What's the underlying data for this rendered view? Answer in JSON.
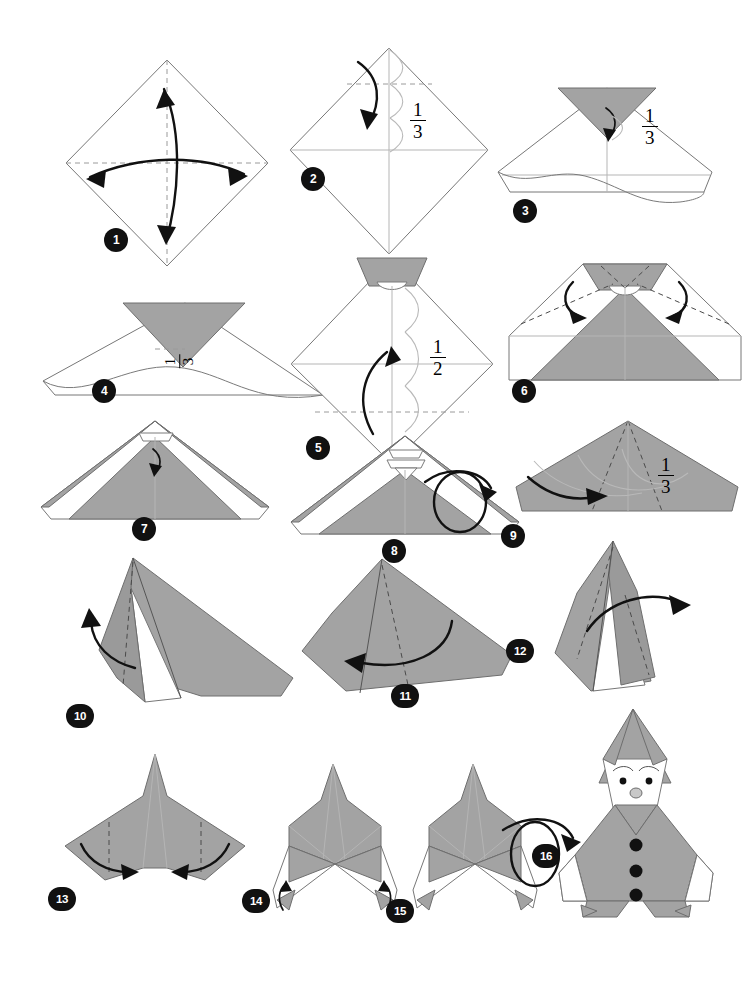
{
  "document": {
    "type": "origami-instruction-diagram",
    "model_name": "Santa Claus",
    "total_steps": 16,
    "page_background": "#ffffff",
    "paper_colors": {
      "front_white": "#ffffff",
      "back_gray": "#a3a3a3",
      "line": "#6e6e6e"
    }
  },
  "steps": [
    {
      "number": "1",
      "label": "1",
      "shape": "square-diamond",
      "annotations": [],
      "symbols": [
        "valley-fold-dashed-vertical",
        "valley-fold-dashed-horizontal",
        "double-arrow-vertical",
        "double-arrow-horizontal"
      ]
    },
    {
      "number": "2",
      "label": "2",
      "shape": "square-diamond",
      "annotations": [
        "1/3"
      ],
      "fraction_numerator": "1",
      "fraction_denominator": "3",
      "symbols": [
        "valley-fold-dashed-horizontal-top",
        "fold-arrow-down",
        "thirds-measure-marks"
      ]
    },
    {
      "number": "3",
      "label": "3",
      "shape": "wide-kite-with-gray-tip-and-wavy-edge",
      "annotations": [
        "1/3"
      ],
      "fraction_numerator": "1",
      "fraction_denominator": "3",
      "symbols": [
        "small-fold-arrow",
        "wavy-cut-edge"
      ]
    },
    {
      "number": "4",
      "label": "4",
      "shape": "wide-kite-with-large-gray-triangle-and-wavy-edge",
      "annotations": [
        "1/3"
      ],
      "fraction_numerator": "1",
      "fraction_denominator": "3",
      "symbols": [
        "rotated-fraction-label",
        "wavy-cut-edge"
      ]
    },
    {
      "number": "5",
      "label": "5",
      "shape": "diamond-with-gray-top-trapezoid",
      "annotations": [
        "1/2"
      ],
      "fraction_numerator": "1",
      "fraction_denominator": "2",
      "symbols": [
        "valley-fold-dashed-horizontal",
        "fold-arrow-up",
        "halves-measure-marks"
      ]
    },
    {
      "number": "6",
      "label": "6",
      "shape": "hexagon-with-central-gray-triangle",
      "annotations": [],
      "symbols": [
        "dashed-diagonal-creases",
        "two-inward-fold-arrows"
      ]
    },
    {
      "number": "7",
      "label": "7",
      "shape": "tent-with-gray-peak-and-white-side-panels",
      "annotations": [],
      "symbols": [
        "small-fold-arrow-center"
      ]
    },
    {
      "number": "8",
      "label": "8",
      "shape": "tent-with-gray-peak-and-white-side-panels",
      "annotations": [],
      "symbols": [
        "turn-over-loop-arrow"
      ]
    },
    {
      "number": "9",
      "label": "9",
      "shape": "gray-pentagon-wide",
      "annotations": [
        "1/3"
      ],
      "fraction_numerator": "1",
      "fraction_denominator": "3",
      "symbols": [
        "dashed-radiating-creases",
        "fold-arrow-right",
        "thirds-measure-marks"
      ]
    },
    {
      "number": "10",
      "label": "10",
      "shape": "angled-gray-form-with-white-flap",
      "annotations": [],
      "symbols": [
        "dashed-crease",
        "fold-arrow-up-left"
      ]
    },
    {
      "number": "11",
      "label": "11",
      "shape": "angled-gray-form",
      "annotations": [],
      "symbols": [
        "dashed-crease",
        "large-fold-arrow-left"
      ]
    },
    {
      "number": "12",
      "label": "12",
      "shape": "narrow-upright-gray-form-with-white-flap",
      "annotations": [],
      "symbols": [
        "dashed-crease",
        "fold-arrow-right"
      ]
    },
    {
      "number": "13",
      "label": "13",
      "shape": "gray-kite-with-pointed-top",
      "annotations": [],
      "symbols": [
        "dashed-vertical-creases",
        "two-inward-fold-arrows"
      ]
    },
    {
      "number": "14",
      "label": "14",
      "shape": "figure-with-hat-body-and-white-legs",
      "annotations": [],
      "symbols": [
        "two-small-upward-arrows-at-feet"
      ]
    },
    {
      "number": "15",
      "label": "15",
      "shape": "figure-with-hat-body-and-white-legs",
      "annotations": [],
      "symbols": [
        "turn-over-loop-arrow"
      ]
    },
    {
      "number": "16",
      "label": "16",
      "shape": "finished-santa-claus",
      "annotations": [],
      "symbols": [
        "face-eyes",
        "face-nose",
        "eyebrows",
        "three-black-buttons"
      ]
    }
  ],
  "fractions": {
    "one_third": {
      "numerator": "1",
      "denominator": "3"
    },
    "one_half": {
      "numerator": "1",
      "denominator": "2"
    }
  }
}
